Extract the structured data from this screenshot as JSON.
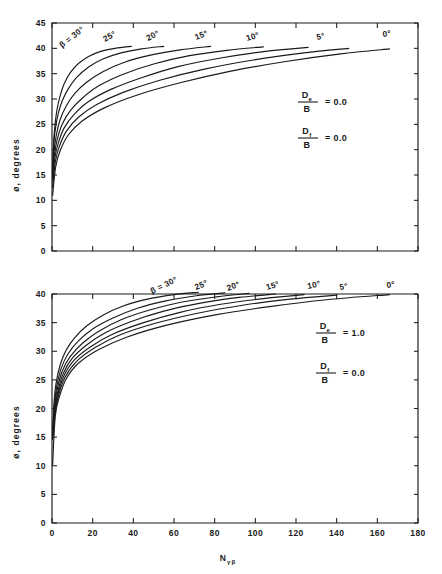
{
  "figure": {
    "background": "#ffffff",
    "ink_color": "#1a1a1a"
  },
  "chart_data": [
    {
      "type": "line",
      "panel": "top",
      "title": "",
      "xlabel": "",
      "ylabel": "ø, degrees",
      "xlim": [
        0,
        180
      ],
      "ylim": [
        0,
        45
      ],
      "xticks": [
        0,
        20,
        40,
        60,
        80,
        100,
        120,
        140,
        160,
        180
      ],
      "xticklabels": [
        "",
        "",
        "",
        "",
        "",
        "",
        "",
        "",
        "",
        ""
      ],
      "yticks": [
        0,
        5,
        10,
        15,
        20,
        25,
        30,
        35,
        40,
        45
      ],
      "yticklabels": [
        "0",
        "5",
        "10",
        "15",
        "20",
        "25",
        "30",
        "35",
        "40",
        "45"
      ],
      "grid": false,
      "legend": "inline-curve-labels",
      "annotations": [
        {
          "numerator": "D",
          "numerator_sub": "e",
          "denominator": "B",
          "equals": "= 0.0"
        },
        {
          "numerator": "D",
          "numerator_sub": "f",
          "denominator": "B",
          "equals": "= 0.0"
        }
      ],
      "series": [
        {
          "name": "β = 30°",
          "label": "β = 30°",
          "label_prefix": "β =",
          "x": [
            0.3,
            0.8,
            1.5,
            2.5,
            4,
            6,
            9,
            13,
            18,
            24,
            31,
            39
          ],
          "values": [
            15.0,
            21.5,
            25.0,
            28.0,
            30.6,
            33.0,
            35.2,
            37.0,
            38.4,
            39.4,
            40.0,
            40.4
          ]
        },
        {
          "name": "25°",
          "label": "25°",
          "x": [
            0.3,
            0.8,
            1.5,
            3,
            5,
            8,
            12,
            18,
            25,
            34,
            44,
            55
          ],
          "values": [
            15.0,
            20.3,
            23.6,
            27.0,
            29.6,
            32.0,
            34.2,
            36.3,
            37.9,
            39.1,
            39.9,
            40.4
          ]
        },
        {
          "name": "20°",
          "label": "20°",
          "x": [
            0.3,
            1.0,
            2.0,
            4,
            7,
            11,
            17,
            25,
            36,
            49,
            63,
            78
          ],
          "values": [
            15.0,
            19.6,
            22.6,
            25.9,
            28.6,
            31.0,
            33.3,
            35.4,
            37.3,
            38.7,
            39.7,
            40.4
          ]
        },
        {
          "name": "15°",
          "label": "15°",
          "x": [
            0.3,
            1.2,
            2.5,
            5,
            9,
            15,
            23,
            35,
            50,
            67,
            86,
            104
          ],
          "values": [
            14.6,
            19.0,
            21.9,
            25.0,
            27.7,
            30.2,
            32.6,
            34.9,
            36.9,
            38.5,
            39.6,
            40.3
          ]
        },
        {
          "name": "10°",
          "label": "10°",
          "x": [
            0.3,
            1.4,
            3.0,
            6,
            11,
            18,
            29,
            44,
            62,
            83,
            105,
            126
          ],
          "values": [
            13.8,
            18.3,
            21.2,
            24.3,
            27.0,
            29.5,
            31.9,
            34.2,
            36.4,
            38.1,
            39.4,
            40.2
          ]
        },
        {
          "name": "5°",
          "label": "5°",
          "x": [
            0.3,
            1.6,
            3.5,
            7,
            13,
            22,
            35,
            53,
            75,
            99,
            124,
            146
          ],
          "values": [
            12.6,
            17.5,
            20.5,
            23.6,
            26.4,
            28.9,
            31.3,
            33.7,
            35.9,
            37.7,
            39.1,
            40.0
          ]
        },
        {
          "name": "0°",
          "label": "0°",
          "x": [
            0.3,
            1.8,
            4.0,
            8,
            15,
            26,
            42,
            63,
            88,
            115,
            142,
            166
          ],
          "values": [
            11.0,
            16.6,
            19.8,
            22.9,
            25.7,
            28.3,
            30.8,
            33.2,
            35.5,
            37.4,
            38.9,
            39.9
          ]
        }
      ]
    },
    {
      "type": "line",
      "panel": "bottom",
      "title": "",
      "xlabel": "N",
      "xlabel_sub": "γβ",
      "ylabel": "ø, degrees",
      "xlim": [
        0,
        180
      ],
      "ylim": [
        0,
        40
      ],
      "xticks": [
        0,
        20,
        40,
        60,
        80,
        100,
        120,
        140,
        160,
        180
      ],
      "xticklabels": [
        "0",
        "20",
        "40",
        "60",
        "80",
        "100",
        "120",
        "140",
        "160",
        "180"
      ],
      "yticks": [
        0,
        5,
        10,
        15,
        20,
        25,
        30,
        35,
        40
      ],
      "yticklabels": [
        "0",
        "5",
        "10",
        "15",
        "20",
        "25",
        "30",
        "35",
        "40"
      ],
      "grid": false,
      "legend": "inline-curve-labels",
      "annotations": [
        {
          "numerator": "D",
          "numerator_sub": "e",
          "denominator": "B",
          "equals": "= 1.0"
        },
        {
          "numerator": "D",
          "numerator_sub": "f",
          "denominator": "B",
          "equals": "= 0.0"
        }
      ],
      "series": [
        {
          "name": "β = 30°",
          "label": "β = 30°",
          "label_prefix": "β =",
          "x": [
            0.3,
            1.0,
            2.0,
            4,
            7,
            11,
            17,
            25,
            35,
            47,
            60,
            72
          ],
          "values": [
            15.2,
            21.0,
            24.4,
            27.6,
            30.2,
            32.3,
            34.4,
            36.3,
            37.9,
            39.1,
            39.9,
            40.3
          ]
        },
        {
          "name": "25°",
          "label": "25°",
          "x": [
            0.3,
            1.1,
            2.3,
            4.5,
            8,
            13,
            20,
            30,
            42,
            56,
            71,
            85
          ],
          "values": [
            15.2,
            20.5,
            23.8,
            27.0,
            29.6,
            31.8,
            33.9,
            35.8,
            37.5,
            38.8,
            39.7,
            40.2
          ]
        },
        {
          "name": "20°",
          "label": "20°",
          "x": [
            0.3,
            1.2,
            2.6,
            5,
            9,
            15,
            23,
            34,
            48,
            64,
            81,
            97
          ],
          "values": [
            15.1,
            20.1,
            23.4,
            26.5,
            29.1,
            31.4,
            33.5,
            35.5,
            37.2,
            38.6,
            39.5,
            40.1
          ]
        },
        {
          "name": "15°",
          "label": "15°",
          "x": [
            0.3,
            1.3,
            2.9,
            5.5,
            10,
            17,
            26,
            39,
            55,
            73,
            92,
            110
          ],
          "values": [
            15.0,
            19.7,
            23.0,
            26.1,
            28.8,
            31.1,
            33.2,
            35.2,
            37.0,
            38.4,
            39.4,
            40.0
          ]
        },
        {
          "name": "10°",
          "label": "10°",
          "x": [
            0.3,
            1.4,
            3.1,
            6,
            11,
            19,
            30,
            45,
            63,
            83,
            104,
            124
          ],
          "values": [
            14.8,
            19.4,
            22.7,
            25.8,
            28.5,
            30.8,
            33.0,
            35.0,
            36.8,
            38.2,
            39.2,
            39.9
          ]
        },
        {
          "name": "5°",
          "label": "5°",
          "x": [
            0.3,
            1.5,
            3.3,
            6.5,
            12,
            21,
            33,
            50,
            71,
            93,
            117,
            140
          ],
          "values": [
            14.6,
            19.1,
            22.4,
            25.5,
            28.2,
            30.6,
            32.8,
            34.8,
            36.6,
            38.0,
            39.1,
            39.8
          ]
        },
        {
          "name": "0°",
          "label": "0°",
          "x": [
            0.3,
            1.6,
            3.6,
            7,
            13,
            23,
            37,
            57,
            81,
            107,
            135,
            166
          ],
          "values": [
            10.2,
            18.6,
            22.0,
            25.2,
            27.9,
            30.3,
            32.5,
            34.6,
            36.4,
            37.8,
            39.0,
            39.9
          ]
        }
      ]
    }
  ]
}
